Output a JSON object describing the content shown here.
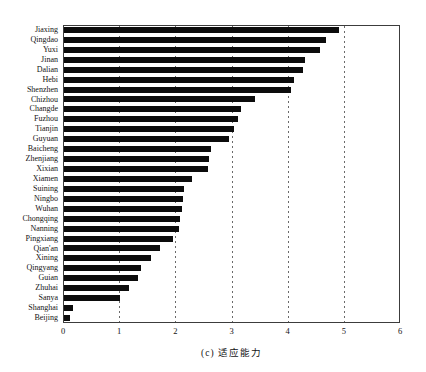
{
  "chart_data": {
    "type": "bar",
    "orientation": "horizontal",
    "title": "",
    "caption": "(c) 适应能力",
    "xlabel": "",
    "ylabel": "",
    "xlim": [
      0,
      6
    ],
    "xtick_labels": [
      "0",
      "1",
      "2",
      "3",
      "4",
      "5",
      "6"
    ],
    "grid": "vertical dashed lines at x=1..5",
    "legend": "none",
    "bar_color": "#0c0c0c",
    "frame_color": "#3c3c3c",
    "categories": [
      "Jiaxing",
      "Qingdao",
      "Yuxi",
      "Jinan",
      "Dalian",
      "Hebi",
      "Shenzhen",
      "Chizhou",
      "Changde",
      "Fuzhou",
      "Tianjin",
      "Guyuan",
      "Baicheng",
      "Zhenjiang",
      "Xixian",
      "Xiamen",
      "Suining",
      "Ningbo",
      "Wuhan",
      "Chongqing",
      "Nanning",
      "Pingxiang",
      "Qian'an",
      "Xining",
      "Qingyang",
      "Guian",
      "Zhuhai",
      "Sanya",
      "Shanghai",
      "Beijing"
    ],
    "values": [
      4.9,
      4.67,
      4.56,
      4.29,
      4.26,
      4.1,
      4.05,
      3.4,
      3.15,
      3.09,
      3.02,
      2.94,
      2.62,
      2.58,
      2.56,
      2.28,
      2.13,
      2.12,
      2.1,
      2.06,
      2.04,
      1.94,
      1.71,
      1.55,
      1.37,
      1.32,
      1.15,
      1.0,
      0.16,
      0.1
    ]
  }
}
